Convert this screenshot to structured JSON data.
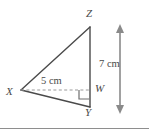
{
  "figure": {
    "type": "geometry-diagram",
    "background_color": "#ffffff",
    "stroke_color": "#4a4a4a",
    "dashed_color": "#9a9a9a",
    "vertices": [
      {
        "id": "Z",
        "label": "Z",
        "x": 90,
        "y": 27
      },
      {
        "id": "X",
        "label": "X",
        "x": 21,
        "y": 90
      },
      {
        "id": "Y",
        "label": "Y",
        "x": 90,
        "y": 107
      },
      {
        "id": "W",
        "label": "W",
        "x": 90,
        "y": 90
      }
    ],
    "segments": [
      {
        "name": "XZ",
        "from": "X",
        "to": "Z",
        "style": "solid"
      },
      {
        "name": "ZY",
        "from": "Z",
        "to": "Y",
        "style": "solid"
      },
      {
        "name": "XY",
        "from": "X",
        "to": "Y",
        "style": "solid"
      },
      {
        "name": "XW",
        "from": "X",
        "to": "W",
        "style": "dashed"
      }
    ],
    "right_angle": {
      "at": "W",
      "between": [
        "XW",
        "WY"
      ]
    },
    "measurements": [
      {
        "id": "base",
        "label": "5 cm",
        "value": 5,
        "unit": "cm",
        "applies_to": "XW"
      },
      {
        "id": "height",
        "label": "7 cm",
        "value": 7,
        "unit": "cm",
        "applies_to": "ZY"
      }
    ],
    "dimension_arrow": {
      "name": "height-arrow",
      "orientation": "vertical",
      "x": 120,
      "y_top": 26,
      "y_bottom": 112,
      "double_headed": true
    },
    "bottom_rule": {
      "visible": true
    }
  }
}
